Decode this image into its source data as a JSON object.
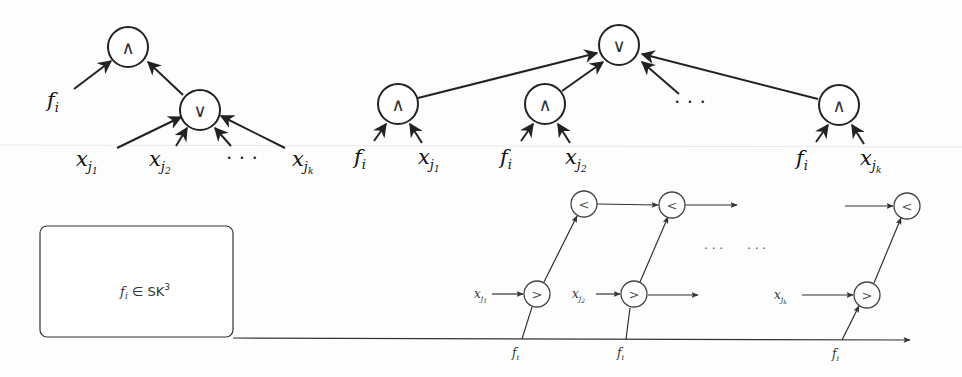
{
  "diagram": {
    "type": "circuit-diagrams",
    "panels": [
      {
        "id": "factored-circuit",
        "nodes": {
          "and": {
            "op": "∧"
          },
          "or": {
            "op": "∨"
          }
        },
        "labels": {
          "f": {
            "base": "f",
            "sub": "i"
          },
          "x1": {
            "base": "x",
            "sub": "j",
            "subsub": "1"
          },
          "x2": {
            "base": "x",
            "sub": "j",
            "subsub": "2"
          },
          "dots": "· · ·",
          "xk": {
            "base": "x",
            "sub": "j",
            "subsub": "k"
          }
        }
      },
      {
        "id": "expanded-circuit",
        "nodes": {
          "or": {
            "op": "∨"
          },
          "and1": {
            "op": "∧"
          },
          "and2": {
            "op": "∧"
          },
          "andk": {
            "op": "∧"
          }
        },
        "labels": {
          "f1": {
            "base": "f",
            "sub": "i"
          },
          "x1": {
            "base": "x",
            "sub": "j",
            "subsub": "1"
          },
          "f2": {
            "base": "f",
            "sub": "i"
          },
          "x2": {
            "base": "x",
            "sub": "j",
            "subsub": "2"
          },
          "dots": "· · ·",
          "fk": {
            "base": "f",
            "sub": "i"
          },
          "xk": {
            "base": "x",
            "sub": "j",
            "subsub": "k"
          }
        }
      },
      {
        "id": "comparator-chain",
        "box": {
          "text_f": "f",
          "text_sub": "i",
          "text_rest": " ∈ SK",
          "text_sup": "3"
        },
        "gt_nodes": [
          {
            "op": ">"
          },
          {
            "op": ">"
          },
          {
            "op": ">"
          }
        ],
        "lt_nodes": [
          {
            "op": "<"
          },
          {
            "op": "<"
          },
          {
            "op": "<"
          }
        ],
        "inputs": [
          {
            "base": "x",
            "sub": "j",
            "subsub": "1"
          },
          {
            "base": "x",
            "sub": "j",
            "subsub": "2"
          },
          {
            "base": "x",
            "sub": "j",
            "subsub": "k"
          }
        ],
        "f_labels": [
          {
            "base": "f",
            "sub": "i"
          },
          {
            "base": "f",
            "sub": "i"
          },
          {
            "base": "f",
            "sub": "i"
          }
        ],
        "dots": [
          "· · ·",
          "· · ·"
        ]
      }
    ]
  }
}
